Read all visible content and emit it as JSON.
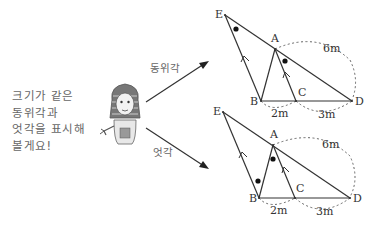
{
  "caption": {
    "lines": [
      "크기가 같은",
      "동위각과",
      "엇각을 표시해",
      "볼게요!"
    ]
  },
  "arrows": {
    "upper_label": "동위각",
    "lower_label": "엇각"
  },
  "character": {
    "icon": "pharaoh-character-icon"
  },
  "diagram_top": {
    "points": {
      "E": "E",
      "A": "A",
      "B": "B",
      "C": "C",
      "D": "D"
    },
    "measurements": {
      "AD": "6m",
      "BC": "2m",
      "CD": "3m"
    },
    "marked_angles": "corresponding angles (동위각) at E and A"
  },
  "diagram_bottom": {
    "points": {
      "E": "E",
      "A": "A",
      "B": "B",
      "C": "C",
      "D": "D"
    },
    "measurements": {
      "AD": "6m",
      "BC": "2m",
      "CD": "3m"
    },
    "marked_angles": "alternate angles (엇각) at B and A"
  }
}
